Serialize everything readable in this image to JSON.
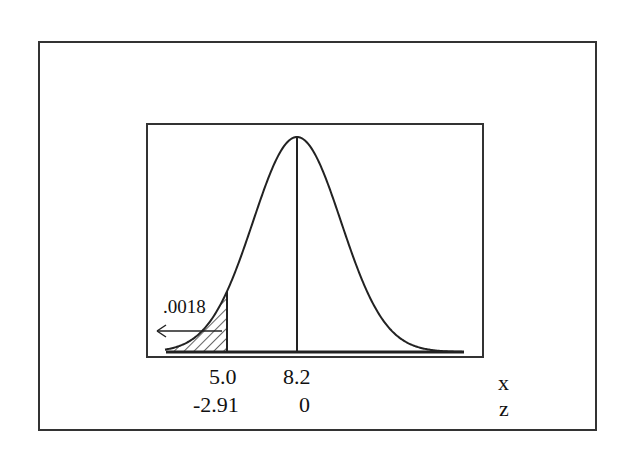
{
  "chart_data": {
    "type": "area",
    "title": "",
    "subtitle": "",
    "mean_x": 8.2,
    "mean_z": 0,
    "cutoff_x": 5.0,
    "cutoff_z": -2.91,
    "shaded_region": "left tail (x < 5.0)",
    "shaded_area": ".0018",
    "axes": {
      "x": {
        "label": "x",
        "ticks": [
          "5.0",
          "8.2"
        ]
      },
      "z": {
        "label": "z",
        "ticks": [
          "-2.91",
          "0"
        ]
      }
    },
    "grid": false,
    "legend": null
  },
  "labels": {
    "shaded_area": ".0018",
    "x_tick_cutoff": "5.0",
    "x_tick_mean": "8.2",
    "z_tick_cutoff": "-2.91",
    "z_tick_mean": "0",
    "x_axis_name": "x",
    "z_axis_name": "z"
  },
  "colors": {
    "line": "#222222",
    "frame": "#333333",
    "background": "#ffffff"
  }
}
